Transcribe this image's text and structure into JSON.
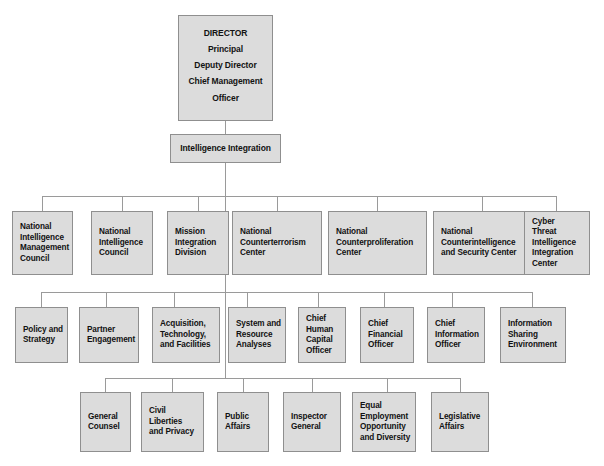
{
  "chart_title": "Office of the Director of National Intelligence organizational chart",
  "style": {
    "box_fill": "#dcdcdc",
    "box_border": "#8f8f8f",
    "line_color": "#9a9a9a",
    "text_color": "#121212",
    "background": "#ffffff"
  },
  "root": {
    "label": "DIRECTOR\nPrincipal\nDeputy Director\nChief Management\nOfficer",
    "lines": [
      "DIRECTOR",
      "Principal",
      "Deputy Director",
      "Chief Management",
      "Officer"
    ]
  },
  "integration": {
    "label": "Intelligence Integration"
  },
  "row2": {
    "items": [
      {
        "label": "National\nIntelligence\nManagement\nCouncil"
      },
      {
        "label": "National\nIntelligence\nCouncil"
      },
      {
        "label": "Mission\nIntegration\nDivision"
      },
      {
        "label": "National\nCounterterrorism\nCenter"
      },
      {
        "label": "National\nCounterproliferation\nCenter"
      },
      {
        "label": "National\nCounterintelligence\nand Security Center"
      },
      {
        "label": "Cyber\nThreat\nIntelligence\nIntegration\nCenter"
      }
    ]
  },
  "row3": {
    "items": [
      {
        "label": "Policy and\nStrategy"
      },
      {
        "label": "Partner\nEngagement"
      },
      {
        "label": "Acquisition,\nTechnology,\nand Facilities"
      },
      {
        "label": "System and\nResource\nAnalyses"
      },
      {
        "label": "Chief\nHuman\nCapital\nOfficer"
      },
      {
        "label": "Chief\nFinancial\nOfficer"
      },
      {
        "label": "Chief\nInformation\nOfficer"
      },
      {
        "label": "Information\nSharing\nEnvironment"
      }
    ]
  },
  "row4": {
    "items": [
      {
        "label": "General\nCounsel"
      },
      {
        "label": "Civil Liberties\nand Privacy"
      },
      {
        "label": "Public\nAffairs"
      },
      {
        "label": "Inspector\nGeneral"
      },
      {
        "label": "Equal\nEmployment\nOpportunity\nand Diversity"
      },
      {
        "label": "Legislative\nAffairs"
      }
    ]
  }
}
